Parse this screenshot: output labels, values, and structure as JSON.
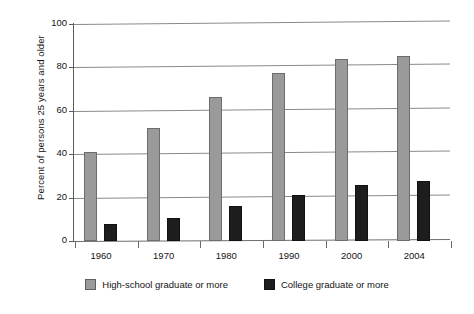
{
  "chart_data": {
    "type": "bar",
    "title": "",
    "xlabel": "",
    "ylabel": "Percent of persons 25 years and older",
    "ylim": [
      0,
      100
    ],
    "yticks": [
      0,
      20,
      40,
      60,
      80,
      100
    ],
    "ytick_labels": [
      "0",
      "20",
      "40",
      "60",
      "80",
      "100"
    ],
    "categories": [
      "1960",
      "1970",
      "1980",
      "1990",
      "2000",
      "2004"
    ],
    "grid": true,
    "legend_position": "bottom",
    "series": [
      {
        "name": "High-school graduate or more",
        "color": "#9a9a9a",
        "values": [
          41.1,
          52.3,
          66.5,
          77.6,
          84.1,
          85.2
        ]
      },
      {
        "name": "College graduate or more",
        "color": "#1d1d1d",
        "values": [
          7.7,
          10.7,
          16.2,
          21.3,
          25.6,
          27.7
        ]
      }
    ]
  },
  "axis": {
    "y_title": "Percent of persons 25 years and older"
  },
  "legend": {
    "entries": [
      {
        "label": "High-school graduate or more",
        "swatch": "gray-swatch"
      },
      {
        "label": "College graduate or more",
        "swatch": "black-swatch"
      }
    ]
  }
}
